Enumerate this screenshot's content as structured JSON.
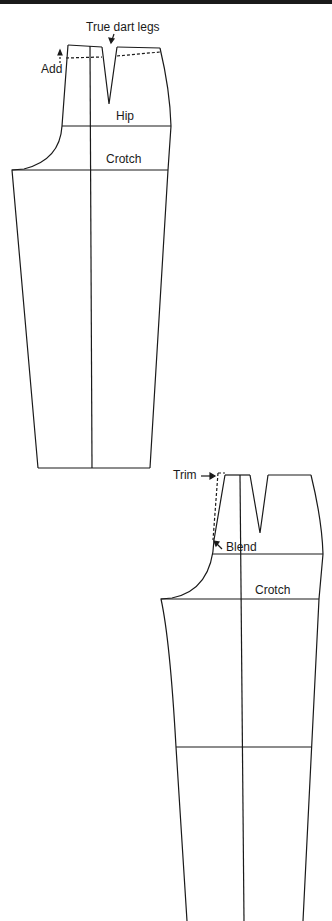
{
  "figure": {
    "type": "pants-pattern-draft",
    "colors": {
      "line": "#1a1a1a",
      "background": "#ffffff"
    }
  },
  "top_pattern": {
    "labels": {
      "true_dart_legs": "True dart legs",
      "add": "Add",
      "hip": "Hip",
      "crotch": "Crotch"
    }
  },
  "bottom_pattern": {
    "labels": {
      "trim": "Trim",
      "blend": "Blend",
      "crotch": "Crotch"
    }
  }
}
